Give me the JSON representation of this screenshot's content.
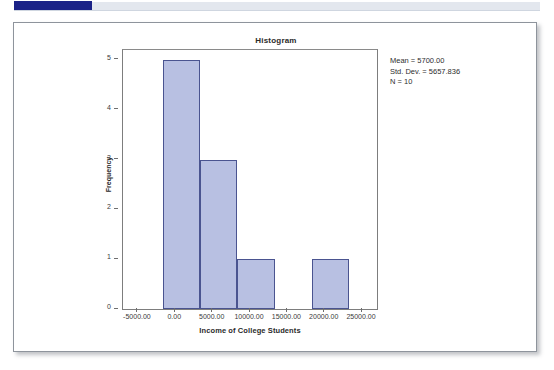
{
  "banner": {
    "blue_block": "",
    "gray_bar": "",
    "blue_color": "#1b2287",
    "gray_color": "#e3e7ee"
  },
  "chart_data": {
    "type": "bar",
    "title": "Histogram",
    "xlabel": "Income of College Students",
    "ylabel": "Frequency",
    "grid": false,
    "legend": "none",
    "xlim": [
      -7000,
      27000
    ],
    "ylim": [
      0,
      5.2
    ],
    "xticks": [
      -5000,
      0,
      5000,
      10000,
      15000,
      20000,
      25000
    ],
    "xtick_labels": [
      "-5000.00",
      "0.00",
      "5000.00",
      "10000.00",
      "15000.00",
      "20000.00",
      "25000.00"
    ],
    "yticks": [
      0,
      1,
      2,
      3,
      4,
      5
    ],
    "ytick_labels": [
      "0",
      "1",
      "2",
      "3",
      "4",
      "5"
    ],
    "bin_width": 5000,
    "bins": [
      {
        "left": -1700,
        "right": 3300,
        "count": 5
      },
      {
        "left": 3300,
        "right": 8300,
        "count": 3
      },
      {
        "left": 8300,
        "right": 13300,
        "count": 1
      },
      {
        "left": 13300,
        "right": 18300,
        "count": 0
      },
      {
        "left": 18300,
        "right": 23300,
        "count": 1
      }
    ],
    "categories": [
      "-1700 to 3300",
      "3300 to 8300",
      "8300 to 13300",
      "13300 to 18300",
      "18300 to 23300"
    ],
    "values": [
      5,
      3,
      1,
      0,
      1
    ],
    "bar_fill_color": "#b8c0e2",
    "bar_border_color": "#4a5490",
    "annotations": {
      "mean": "Mean = 5700.00",
      "std_dev": "Std. Dev. = 5657.836",
      "n": "N = 10"
    }
  }
}
